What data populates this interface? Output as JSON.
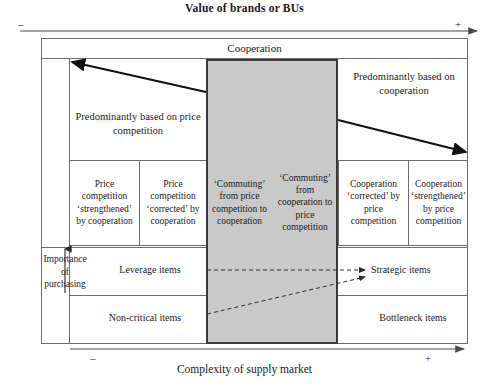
{
  "title": "Value of brands or BUs",
  "axes": {
    "top": {
      "label": "Value of brands or BUs",
      "minus": "–",
      "plus": "+"
    },
    "bottom": {
      "label": "Complexity of supply market",
      "minus": "–",
      "plus": "+"
    },
    "left": {
      "label": "Importance of purchasing"
    }
  },
  "band": {
    "cooperation": "Cooperation"
  },
  "headers": {
    "left_block": "Predominantly based on price competition",
    "right_block": "Predominantly based on cooperation"
  },
  "strategy_cells": [
    {
      "id": "price-competition-strengthened",
      "text": "Price competition ‘strengthened’ by cooperation",
      "shaded": false
    },
    {
      "id": "price-competition-corrected",
      "text": "Price competition ‘corrected’ by cooperation",
      "shaded": false
    },
    {
      "id": "commuting-price-to-cooperation",
      "text": "‘Commuting’ from price competition to cooperation",
      "shaded": true
    },
    {
      "id": "commuting-cooperation-to-price",
      "text": "‘Commuting’ from cooperation to price competition",
      "shaded": true
    },
    {
      "id": "cooperation-corrected",
      "text": "Cooperation ‘corrected’ by price competition",
      "shaded": false
    },
    {
      "id": "cooperation-strengthened",
      "text": "Cooperation ‘strengthened’ by price competition",
      "shaded": false
    }
  ],
  "kraljic_items": {
    "leverage": "Leverage items",
    "strategic": "Strategic items",
    "non_critical": "Non-critical items",
    "bottleneck": "Bottleneck items"
  },
  "colors": {
    "shaded_fill": "#c9c9c9",
    "shaded_border": "#3a3a3a",
    "grid_line": "#6e6e6e",
    "text": "#1a1a1a"
  }
}
